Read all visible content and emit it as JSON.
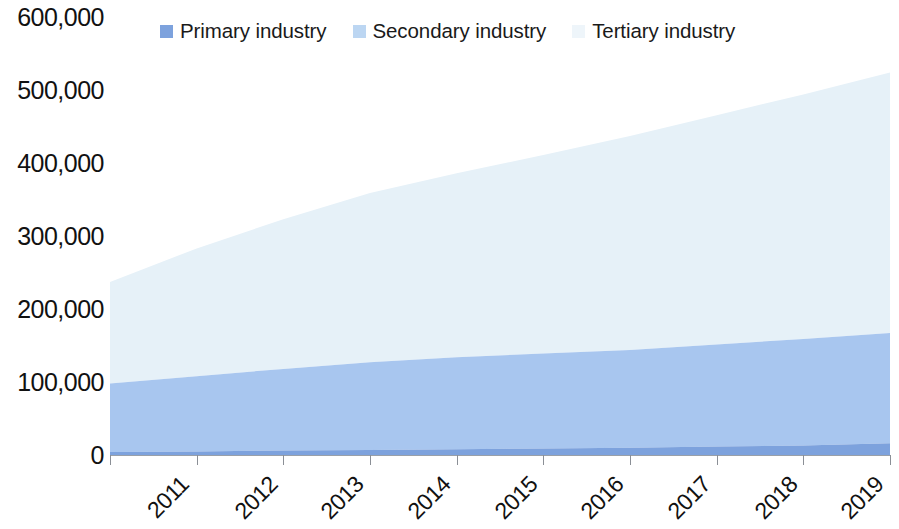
{
  "chart_data": {
    "type": "area",
    "stacked": true,
    "title": "",
    "subtitle": "",
    "xlabel": "",
    "ylabel": "",
    "categories": [
      "2011",
      "2012",
      "2013",
      "2014",
      "2015",
      "2016",
      "2017",
      "2018",
      "2019",
      "2020"
    ],
    "x": [
      2011,
      2012,
      2013,
      2014,
      2015,
      2016,
      2017,
      2018,
      2019,
      2020
    ],
    "series": [
      {
        "name": "Primary industry",
        "color": "#7da2dd",
        "values": [
          4000,
          5000,
          6000,
          7000,
          8000,
          9000,
          10000,
          11500,
          13000,
          16000
        ]
      },
      {
        "name": "Secondary industry",
        "color": "#a8c6ef",
        "values": [
          94000,
          103000,
          112000,
          120000,
          126000,
          130000,
          134000,
          140000,
          146000,
          151000
        ]
      },
      {
        "name": "Tertiary industry",
        "color": "#e6f1f8",
        "values": [
          139000,
          175000,
          205000,
          232000,
          252000,
          272000,
          293000,
          314000,
          335000,
          357000
        ]
      }
    ],
    "cumulative_totals": [
      237000,
      283000,
      323000,
      359000,
      386000,
      411000,
      437000,
      465000,
      494000,
      524000
    ],
    "yticks": [
      "0",
      "100,000",
      "200,000",
      "300,000",
      "400,000",
      "500,000",
      "600,000"
    ],
    "ytick_values": [
      0,
      100000,
      200000,
      300000,
      400000,
      500000,
      600000
    ],
    "ylim": [
      0,
      600000
    ],
    "xlim": [
      2011,
      2020
    ],
    "grid": false,
    "legend_position": "top"
  },
  "legend": {
    "items": [
      {
        "label": "Primary industry",
        "color": "#7da2dd",
        "name": "primary-industry"
      },
      {
        "label": "Secondary industry",
        "color": "#bcd6f2",
        "name": "secondary-industry"
      },
      {
        "label": "Tertiary industry",
        "color": "#eef5fa",
        "name": "tertiary-industry"
      }
    ]
  },
  "axes": {
    "y": {
      "ticks": [
        "600,000",
        "500,000",
        "400,000",
        "300,000",
        "200,000",
        "100,000",
        "0"
      ]
    },
    "x": {
      "ticks": [
        "2011",
        "2012",
        "2013",
        "2014",
        "2015",
        "2016",
        "2017",
        "2018",
        "2019",
        "2020"
      ]
    }
  },
  "colors": {
    "primary": "#7da2dd",
    "secondary": "#a8c6ef",
    "tertiary": "#e6f1f8",
    "axis": "#9aa0a8",
    "text": "#111111",
    "background": "#ffffff"
  }
}
